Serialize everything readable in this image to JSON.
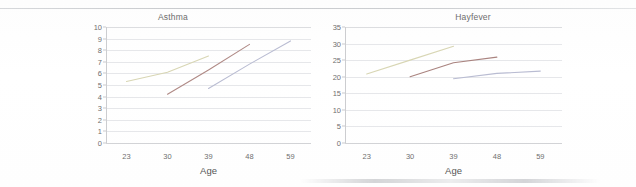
{
  "document": {
    "has_top_rule": true,
    "has_bottom_artifact": true,
    "background_color": "#ffffff"
  },
  "charts": [
    {
      "id": "asthma",
      "title": "Asthma",
      "xlabel": "Age"
    },
    {
      "id": "hayfever",
      "title": "Hayfever",
      "xlabel": "Age"
    }
  ],
  "chart_data": [
    {
      "type": "line",
      "title": "Asthma",
      "xlabel": "Age",
      "ylabel": "",
      "x": [
        23,
        30,
        39,
        48,
        59
      ],
      "categories": [
        "23",
        "30",
        "39",
        "48",
        "59"
      ],
      "xtick_labels": [
        "23",
        "30",
        "39",
        "48",
        "59"
      ],
      "ylim": [
        0,
        10
      ],
      "ytick_labels": [
        "0",
        "1",
        "2",
        "3",
        "4",
        "5",
        "6",
        "7",
        "8",
        "9",
        "10"
      ],
      "ytick_values": [
        0,
        1,
        2,
        3,
        4,
        5,
        6,
        7,
        8,
        9,
        10
      ],
      "grid": true,
      "legend": false,
      "legend_position": "none",
      "series": [
        {
          "name": "cohort-1",
          "color": "#d8d6b4",
          "x": [
            23,
            30,
            39
          ],
          "values": [
            5.3,
            6.1,
            7.5
          ]
        },
        {
          "name": "cohort-2",
          "color": "#b08a86",
          "x": [
            30,
            39,
            48
          ],
          "values": [
            4.2,
            6.3,
            8.5
          ]
        },
        {
          "name": "cohort-3",
          "color": "#b9bcd2",
          "x": [
            39,
            48,
            59
          ],
          "values": [
            4.7,
            6.8,
            8.8
          ]
        }
      ]
    },
    {
      "type": "line",
      "title": "Hayfever",
      "xlabel": "Age",
      "ylabel": "",
      "x": [
        23,
        30,
        39,
        48,
        59
      ],
      "categories": [
        "23",
        "30",
        "39",
        "48",
        "59"
      ],
      "xtick_labels": [
        "23",
        "30",
        "39",
        "48",
        "59"
      ],
      "ylim": [
        0,
        35
      ],
      "ytick_labels": [
        "0",
        "5",
        "10",
        "15",
        "20",
        "25",
        "30",
        "35"
      ],
      "ytick_values": [
        0,
        5,
        10,
        15,
        20,
        25,
        30,
        35
      ],
      "grid": true,
      "legend": false,
      "legend_position": "none",
      "series": [
        {
          "name": "cohort-1",
          "color": "#d8d6b4",
          "x": [
            23,
            30,
            39
          ],
          "values": [
            20.8,
            25.0,
            29.2
          ]
        },
        {
          "name": "cohort-2",
          "color": "#a9837f",
          "x": [
            30,
            39,
            48
          ],
          "values": [
            20.0,
            24.2,
            25.9
          ]
        },
        {
          "name": "cohort-3",
          "color": "#b9bcd2",
          "x": [
            39,
            48,
            59
          ],
          "values": [
            19.4,
            21.0,
            21.7
          ]
        }
      ]
    }
  ]
}
